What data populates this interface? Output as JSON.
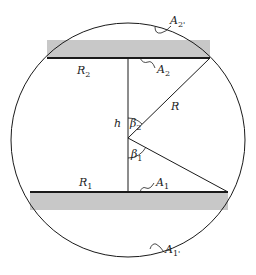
{
  "diagram": {
    "type": "geometry",
    "colors": {
      "plate": "#c8c8c8",
      "line": "#1a1a1a",
      "background": "#ffffff"
    },
    "labels": {
      "R2": {
        "main": "R",
        "sub": "2"
      },
      "R1": {
        "main": "R",
        "sub": "1"
      },
      "R": {
        "main": "R"
      },
      "h": {
        "main": "h"
      },
      "beta2": {
        "main": "β",
        "sub": "2"
      },
      "beta1": {
        "main": "β",
        "sub": "1"
      },
      "A2": {
        "main": "A",
        "sub": "2"
      },
      "A1": {
        "main": "A",
        "sub": "1"
      },
      "A2prime": {
        "main": "A",
        "sub": "2'"
      },
      "A1prime": {
        "main": "A",
        "sub": "1'"
      }
    }
  }
}
